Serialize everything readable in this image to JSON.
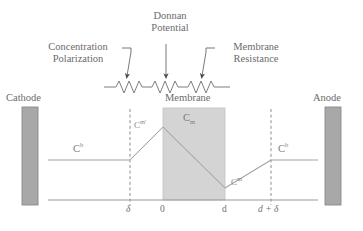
{
  "diagram": {
    "title_annotations": {
      "donnan": "Donnan\nPotential",
      "donnan_line1": "Donnan",
      "donnan_line2": "Potential",
      "concentration_line1": "Concentration",
      "concentration_line2": "Polarization",
      "membrane_res_line1": "Membrane",
      "membrane_res_line2": "Resistance"
    },
    "electrodes": {
      "cathode": "Cathode",
      "anode": "Anode"
    },
    "membrane_label": "Membrane",
    "concentration_labels": {
      "bulk_left": "C",
      "bulk_left_sup": "b",
      "surface_left": "C",
      "surface_left_sup": "m'",
      "membrane": "C",
      "membrane_sub": "m",
      "surface_right": "C",
      "surface_right_sup": "m",
      "bulk_right": "C",
      "bulk_right_sup": "b"
    },
    "axis_ticks": [
      {
        "label": "δ",
        "name": "tick-delta"
      },
      {
        "label": "0",
        "name": "tick-zero"
      },
      {
        "label": "d",
        "name": "tick-d"
      },
      {
        "label": "d + δ",
        "name": "tick-d-plus-delta"
      }
    ],
    "colors": {
      "electrode_fill": "#a8a8a8",
      "electrode_stroke": "#8c8c8c",
      "membrane_fill": "#d4d4d4",
      "membrane_stroke": "#bdbdbd",
      "line": "#9a9a9a",
      "axis": "#8f8f8f",
      "text": "#6b6b6b",
      "arrow": "#4a4a4a",
      "background": "#ffffff"
    },
    "resistor_count": 3
  }
}
